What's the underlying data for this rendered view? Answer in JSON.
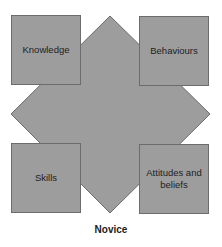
{
  "diagram": {
    "boxes": [
      {
        "id": "top-left",
        "label": "Knowledge"
      },
      {
        "id": "top-right",
        "label": "Behaviours"
      },
      {
        "id": "bottom-left",
        "label": "Skills"
      },
      {
        "id": "bottom-right",
        "label": "Attitudes and beliefs"
      }
    ],
    "caption": "Novice",
    "colors": {
      "fill": "#9d9d9d",
      "stroke": "#6c6c6c",
      "background": "#ffffff"
    }
  }
}
